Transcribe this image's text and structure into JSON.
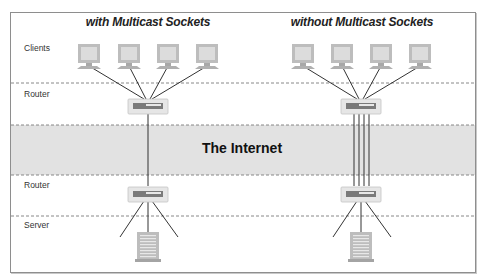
{
  "diagram": {
    "panels": [
      {
        "title": "with Multicast Sockets",
        "center_x": 148,
        "uplinks": 1
      },
      {
        "title": "without Multicast Sockets",
        "center_x": 361,
        "uplinks": 4
      }
    ],
    "row_labels": [
      {
        "label": "Clients",
        "y": 43
      },
      {
        "label": "Router",
        "y": 89
      },
      {
        "label": "Router",
        "y": 180
      },
      {
        "label": "Server",
        "y": 220
      }
    ],
    "internet_label": "The Internet",
    "colors": {
      "band": "#e2e2e2",
      "dashes": "#7a7a7a",
      "device_fill": "#bdbdbd",
      "screen": "#dcdcdc",
      "lines": "#333333",
      "router_panel": "#7a7a7a"
    },
    "nodes": {
      "clients_per_panel": 4,
      "routers_per_panel": 2,
      "servers_per_panel": 1
    }
  }
}
